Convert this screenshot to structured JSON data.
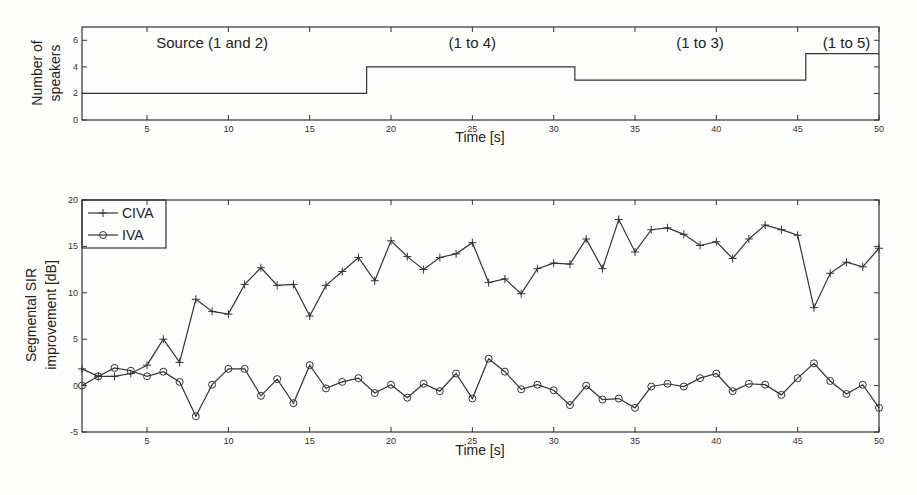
{
  "chart_data": [
    {
      "type": "line",
      "title": "",
      "xlabel": "Time [s]",
      "ylabel": "Number of speakers",
      "xlim": [
        1,
        50
      ],
      "ylim": [
        0,
        7
      ],
      "xticks": [
        5,
        10,
        15,
        20,
        25,
        30,
        35,
        40,
        45,
        50
      ],
      "yticks": [
        0,
        2,
        4,
        6
      ],
      "grid": false,
      "series": [
        {
          "name": "speakers",
          "step": true,
          "x": [
            1,
            18.5,
            18.5,
            31.3,
            31.3,
            45.5,
            45.5,
            50
          ],
          "values": [
            2,
            2,
            4,
            4,
            3,
            3,
            5,
            5
          ]
        }
      ],
      "annotations": [
        {
          "text": "Source (1 and 2)",
          "x": 9
        },
        {
          "text": "(1 to 4)",
          "x": 25
        },
        {
          "text": "(1 to 3)",
          "x": 39
        },
        {
          "text": "(1 to 5)",
          "x": 48
        }
      ]
    },
    {
      "type": "line",
      "title": "",
      "xlabel": "Time [s]",
      "ylabel": "Segmental SIR improvement [dB]",
      "xlim": [
        1,
        50
      ],
      "ylim": [
        -5,
        20
      ],
      "xticks": [
        5,
        10,
        15,
        20,
        25,
        30,
        35,
        40,
        45,
        50
      ],
      "yticks": [
        -5,
        0,
        5,
        10,
        15,
        20
      ],
      "grid": false,
      "legend": "top-left",
      "x": [
        1,
        2,
        3,
        4,
        5,
        6,
        7,
        8,
        9,
        10,
        11,
        12,
        13,
        14,
        15,
        16,
        17,
        18,
        19,
        20,
        21,
        22,
        23,
        24,
        25,
        26,
        27,
        28,
        29,
        30,
        31,
        32,
        33,
        34,
        35,
        36,
        37,
        38,
        39,
        40,
        41,
        42,
        43,
        44,
        45,
        46,
        47,
        48,
        49,
        50
      ],
      "series": [
        {
          "name": "CIVA",
          "marker": "plus",
          "values": [
            1.8,
            1.0,
            1.0,
            1.3,
            2.2,
            5.0,
            2.5,
            9.3,
            8.0,
            7.7,
            10.9,
            12.7,
            10.8,
            10.9,
            7.5,
            10.8,
            12.3,
            13.8,
            11.3,
            15.6,
            13.9,
            12.5,
            13.8,
            14.2,
            15.4,
            11.1,
            11.5,
            9.9,
            12.6,
            13.2,
            13.1,
            15.8,
            12.6,
            17.9,
            14.4,
            16.8,
            17.0,
            16.3,
            15.1,
            15.5,
            13.7,
            15.8,
            17.3,
            16.8,
            16.2,
            8.4,
            12.1,
            13.3,
            12.8,
            14.8
          ]
        },
        {
          "name": "IVA",
          "marker": "circle",
          "values": [
            0.0,
            1.0,
            1.9,
            1.6,
            1.0,
            1.5,
            0.4,
            -3.3,
            0.1,
            1.8,
            1.8,
            -1.1,
            0.7,
            -1.9,
            2.2,
            -0.3,
            0.4,
            0.8,
            -0.8,
            0.1,
            -1.3,
            0.2,
            -0.6,
            1.3,
            -1.4,
            2.9,
            1.5,
            -0.4,
            0.1,
            -0.5,
            -2.1,
            0.0,
            -1.5,
            -1.4,
            -2.4,
            -0.1,
            0.2,
            -0.1,
            0.8,
            1.3,
            -0.6,
            0.2,
            0.1,
            -1.0,
            0.8,
            2.4,
            0.5,
            -0.9,
            0.1,
            -2.4
          ]
        }
      ]
    }
  ]
}
